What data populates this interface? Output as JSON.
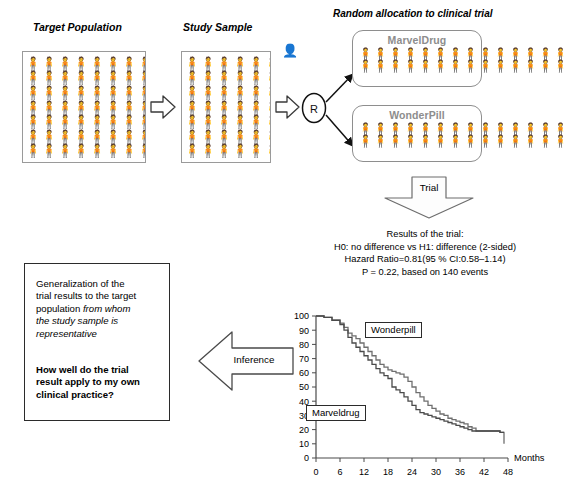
{
  "diagram": {
    "title_random": "Random allocation to clinical trial",
    "target_population_label": "Target Population",
    "study_sample_label": "Study Sample",
    "randomization_marker": "R",
    "arms": [
      {
        "name": "MarvelDrug",
        "rows": 2,
        "per_row": 14
      },
      {
        "name": "WonderPill",
        "rows": 2,
        "per_row": 14
      }
    ],
    "trial_arrow_label": "Trial",
    "inference_arrow_label": "Inference",
    "person_glyph": "person-icon",
    "target_grid": {
      "rows": 7,
      "cols": 13
    },
    "sample_grid": {
      "rows": 7,
      "cols": 13
    }
  },
  "results": {
    "line1": "Results of the trial:",
    "line2": "H0: no difference vs H1: difference (2-sided)",
    "line3": "Hazard Ratio=0.81(95 % CI:0.58–1.14)",
    "line4": "P = 0.22, based on 140 events"
  },
  "generalization": {
    "paragraph_plain_1": "Generalization of the",
    "paragraph_plain_2": "trial results to the target",
    "paragraph_plain_3": "population ",
    "paragraph_italic_1": "from whom",
    "paragraph_italic_2": "the study sample is",
    "paragraph_italic_3": "representative",
    "question_1": "How well do the trial",
    "question_2": "result apply to my own",
    "question_3": "clinical practice?"
  },
  "chart_data": {
    "type": "line",
    "title": "",
    "xlabel": "Months",
    "ylabel": "",
    "xlim": [
      0,
      48
    ],
    "ylim": [
      0,
      100
    ],
    "xticks": [
      0,
      6,
      12,
      18,
      24,
      30,
      36,
      42,
      48
    ],
    "yticks": [
      0,
      10,
      20,
      30,
      40,
      50,
      60,
      70,
      80,
      90,
      100
    ],
    "grid": false,
    "legend": "inline-labels",
    "annotations": [
      {
        "text": "Wonderpill",
        "x": 15,
        "y": 88
      },
      {
        "text": "Marveldrug",
        "x": 6.5,
        "y": 43
      }
    ],
    "series": [
      {
        "name": "Wonderpill",
        "color": "#6f6f6f",
        "x": [
          0,
          2,
          4,
          6,
          7,
          8,
          9,
          10,
          11,
          12,
          13,
          14,
          15,
          16,
          17,
          18,
          19,
          20,
          21,
          22,
          23,
          24,
          25,
          26,
          27,
          28,
          29,
          30,
          31,
          32,
          33,
          34,
          35,
          36,
          37,
          38,
          39,
          40,
          44,
          46,
          47
        ],
        "y": [
          100,
          99,
          97,
          95,
          92,
          88,
          86,
          84,
          81,
          78,
          75,
          72,
          69,
          66,
          64,
          62,
          61,
          60,
          59,
          57,
          54,
          50,
          46,
          43,
          40,
          37,
          35,
          33,
          31,
          30,
          28,
          27,
          26,
          25,
          24,
          22,
          21,
          19,
          19,
          18,
          10
        ]
      },
      {
        "name": "Marveldrug",
        "color": "#4a4a4a",
        "x": [
          0,
          2,
          4,
          6,
          7,
          8,
          9,
          10,
          11,
          12,
          13,
          14,
          15,
          16,
          17,
          18,
          19,
          20,
          21,
          22,
          23,
          24,
          25,
          26,
          27,
          28,
          29,
          30,
          31,
          32,
          33,
          34,
          35,
          36,
          37,
          38,
          39,
          40,
          44,
          46,
          47
        ],
        "y": [
          100,
          99,
          97,
          94,
          90,
          85,
          81,
          78,
          75,
          72,
          69,
          66,
          63,
          60,
          58,
          56,
          50,
          48,
          46,
          43,
          40,
          37,
          34,
          32,
          31,
          30,
          29,
          28,
          27,
          26,
          25,
          24,
          23,
          22,
          21,
          20,
          19,
          19,
          19,
          18,
          18
        ]
      }
    ]
  }
}
